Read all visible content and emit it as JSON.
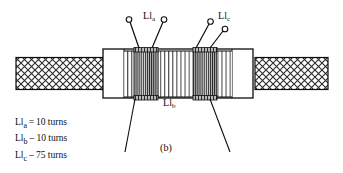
{
  "figure": {
    "caption": "(b)",
    "labels": {
      "lla": "Ll",
      "lla_sub": "a",
      "llb": "Ll",
      "llb_sub": "b",
      "llc": "Ll",
      "llc_sub": "c"
    },
    "legend": [
      {
        "symbol": "Ll",
        "subscript": "a",
        "relation": "=",
        "value": "10 turns"
      },
      {
        "symbol": "Ll",
        "subscript": "b",
        "relation": "–",
        "value": "10 turns"
      },
      {
        "symbol": "Ll",
        "subscript": "c",
        "relation": "–",
        "value": "75 turns"
      }
    ],
    "colors": {
      "ink": "#0d0d0d",
      "background": "#ffffff",
      "hatch": "#2b2b2b",
      "winding": "#3a3a3a",
      "tap_block": "#555555"
    }
  }
}
